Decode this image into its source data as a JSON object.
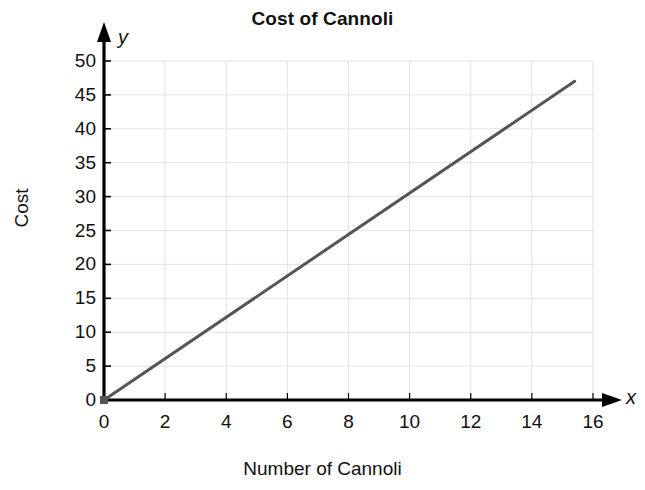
{
  "chart_data": {
    "type": "line",
    "title": "Cost of Cannoli",
    "xlabel": "Number of Cannoli",
    "ylabel": "Cost",
    "x_axis_variable": "x",
    "y_axis_variable": "y",
    "xlim": [
      0,
      16
    ],
    "ylim": [
      0,
      50
    ],
    "xticks": [
      0,
      2,
      4,
      6,
      8,
      10,
      12,
      14,
      16
    ],
    "xtick_labels": [
      "0",
      "2",
      "4",
      "6",
      "8",
      "10",
      "12",
      "14",
      "16"
    ],
    "yticks": [
      0,
      5,
      10,
      15,
      20,
      25,
      30,
      35,
      40,
      45,
      50
    ],
    "ytick_labels": [
      "0",
      "5",
      "10",
      "15",
      "20",
      "25",
      "30",
      "35",
      "40",
      "45",
      "50"
    ],
    "grid": true,
    "grid_color": "#e3e3e3",
    "legend": false,
    "line_color": "#555555",
    "line_width": 3,
    "axis_color": "#000000",
    "background": "#ffffff",
    "series": [
      {
        "name": "Cost of Cannoli",
        "slope": 3.05,
        "intercept": 0,
        "x": [
          0,
          15.4
        ],
        "values": [
          0,
          47
        ]
      }
    ],
    "points": [
      {
        "x": 0,
        "y": 0,
        "marker": true
      }
    ],
    "annotations": []
  },
  "figure": {
    "title": "Cost of Cannoli",
    "x_axis_title": "Number of Cannoli",
    "y_axis_title": "Cost",
    "x_axis_variable": "x",
    "y_axis_variable": "y"
  }
}
